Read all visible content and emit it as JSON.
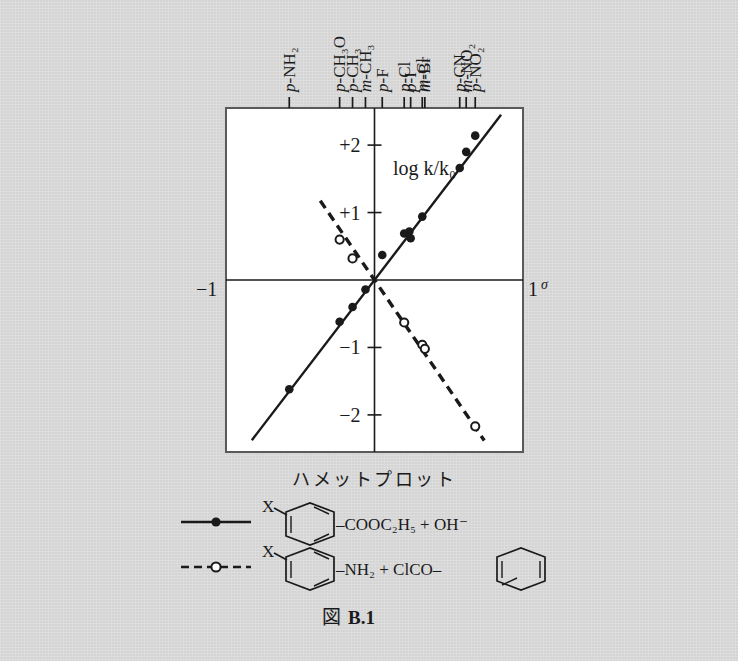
{
  "figure": {
    "caption_prefix": "図",
    "caption_number": "B.1",
    "plot_title": "ハメットプロット",
    "y_axis_label": "log k/k₀",
    "x_axis_symbol": "σ",
    "x_left_label": "−1",
    "x_right_label": "1",
    "y_tick_labels": [
      "+2",
      "+1",
      "−1",
      "−2"
    ]
  },
  "legend": {
    "series": [
      {
        "marker": "filled-circle",
        "line_style": "solid",
        "substrate_prefix": "X",
        "ring": "benzene-ring",
        "formula": "–COOC₂H₅ + OH⁻"
      },
      {
        "marker": "open-circle",
        "line_style": "dashed",
        "substrate_prefix": "X",
        "ring": "benzene-ring",
        "formula": "–NH₂ + ClCO–",
        "formula_tail_ring": "benzene-ring"
      }
    ]
  },
  "chart_data": {
    "type": "scatter",
    "title": "ハメットプロット",
    "xlabel": "σ",
    "ylabel": "log k/k₀",
    "xlim": [
      -1.15,
      1.15
    ],
    "ylim": [
      -2.55,
      2.55
    ],
    "grid": false,
    "axes": {
      "x_axis_at_y": 0,
      "y_axis_at_x": 0,
      "y_ticks": [
        2,
        1,
        -1,
        -2
      ],
      "x_ticks_labeled": [
        -1,
        1
      ]
    },
    "substituent_ticks": [
      {
        "label": "p-NH₂",
        "sigma": -0.66
      },
      {
        "label": "p-CH₃O",
        "sigma": -0.27
      },
      {
        "label": "p-CH₃",
        "sigma": -0.17
      },
      {
        "label": "m-CH₃",
        "sigma": -0.07
      },
      {
        "label": "p-F",
        "sigma": 0.06
      },
      {
        "label": "p-Cl",
        "sigma": 0.23
      },
      {
        "label": "p-I",
        "sigma": 0.28
      },
      {
        "label": "m-Cl",
        "sigma": 0.37
      },
      {
        "label": "m-Br",
        "sigma": 0.39
      },
      {
        "label": "p-CN",
        "sigma": 0.66
      },
      {
        "label": "m-NO₂",
        "sigma": 0.71
      },
      {
        "label": "p-NO₂",
        "sigma": 0.78
      }
    ],
    "series": [
      {
        "name": "ester-hydrolysis",
        "marker": "filled-circle",
        "line_style": "solid",
        "slope": 2.5,
        "intercept": 0.0,
        "line_x_range": [
          -0.95,
          0.98
        ],
        "points": [
          {
            "x": -0.66,
            "y": -1.62
          },
          {
            "x": -0.27,
            "y": -0.62
          },
          {
            "x": -0.17,
            "y": -0.4
          },
          {
            "x": -0.07,
            "y": -0.14
          },
          {
            "x": 0.06,
            "y": 0.37
          },
          {
            "x": 0.23,
            "y": 0.69
          },
          {
            "x": 0.27,
            "y": 0.72
          },
          {
            "x": 0.28,
            "y": 0.62
          },
          {
            "x": 0.37,
            "y": 0.94
          },
          {
            "x": 0.66,
            "y": 1.66
          },
          {
            "x": 0.71,
            "y": 1.9
          },
          {
            "x": 0.78,
            "y": 2.14
          }
        ]
      },
      {
        "name": "amine-acylation",
        "marker": "open-circle",
        "line_style": "dashed",
        "slope": -2.8,
        "intercept": 0.0,
        "line_x_range": [
          -0.42,
          0.85
        ],
        "points": [
          {
            "x": -0.27,
            "y": 0.6
          },
          {
            "x": -0.17,
            "y": 0.32
          },
          {
            "x": 0.23,
            "y": -0.63
          },
          {
            "x": 0.37,
            "y": -0.96
          },
          {
            "x": 0.39,
            "y": -1.02
          },
          {
            "x": 0.78,
            "y": -2.17
          }
        ]
      }
    ]
  },
  "colors": {
    "page_background": "#d4d4d4",
    "ink": "#1a1a1a",
    "plot_background": "#ffffff",
    "frame": "#555555"
  }
}
